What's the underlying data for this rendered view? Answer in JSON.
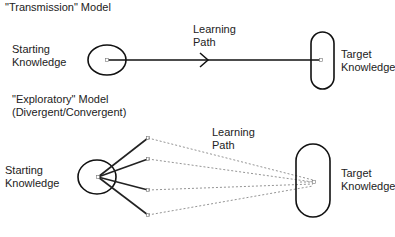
{
  "transmission": {
    "title": "\"Transmission\" Model",
    "start_line1": "Starting",
    "start_line2": "Knowledge",
    "path_line1": "Learning",
    "path_line2": "Path",
    "target_line1": "Target",
    "target_line2": "Knowledge"
  },
  "exploratory": {
    "title_line1": "\"Exploratory\" Model",
    "title_line2": "(Divergent/Convergent)",
    "start_line1": "Starting",
    "start_line2": "Knowledge",
    "path_line1": "Learning",
    "path_line2": "Path",
    "target_line1": "Target",
    "target_line2": "Knowledge"
  }
}
